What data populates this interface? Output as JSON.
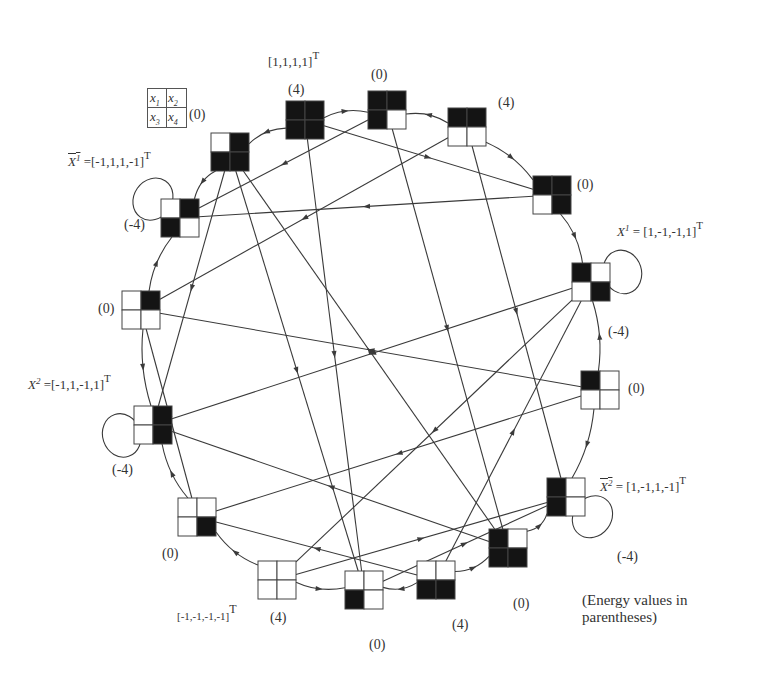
{
  "diagram": {
    "type": "state-transition-graph",
    "colors": {
      "black": "#141414",
      "white": "#ffffff",
      "line": "#3a3a3a"
    },
    "legend_grid": {
      "cells": [
        "x1",
        "x2",
        "x3",
        "x4"
      ],
      "energy": "(0)"
    },
    "nodes": [
      {
        "id": "n1",
        "x": 305,
        "y": 120,
        "state": [
          1,
          1,
          1,
          1
        ],
        "energy": "(4)"
      },
      {
        "id": "n2",
        "x": 387,
        "y": 110,
        "state": [
          1,
          1,
          1,
          0
        ],
        "energy": "(0)"
      },
      {
        "id": "n3",
        "x": 467,
        "y": 127,
        "state": [
          1,
          1,
          0,
          0
        ],
        "energy": "(4)"
      },
      {
        "id": "n4",
        "x": 552,
        "y": 195,
        "state": [
          1,
          1,
          0,
          1
        ],
        "energy": "(0)"
      },
      {
        "id": "n5",
        "x": 591,
        "y": 282,
        "state": [
          1,
          0,
          0,
          1
        ],
        "energy": "(-4)"
      },
      {
        "id": "n6",
        "x": 600,
        "y": 390,
        "state": [
          1,
          0,
          0,
          0
        ],
        "energy": "(0)"
      },
      {
        "id": "n7",
        "x": 566,
        "y": 497,
        "state": [
          1,
          0,
          1,
          0
        ],
        "energy": "(-4)"
      },
      {
        "id": "n8",
        "x": 508,
        "y": 548,
        "state": [
          1,
          0,
          1,
          1
        ],
        "energy": "(0)"
      },
      {
        "id": "n9",
        "x": 436,
        "y": 580,
        "state": [
          0,
          0,
          1,
          1
        ],
        "energy": "(4)"
      },
      {
        "id": "n10",
        "x": 364,
        "y": 590,
        "state": [
          0,
          0,
          1,
          0
        ],
        "energy": "(0)"
      },
      {
        "id": "n11",
        "x": 277,
        "y": 580,
        "state": [
          0,
          0,
          0,
          0
        ],
        "energy": "(4)"
      },
      {
        "id": "n12",
        "x": 197,
        "y": 517,
        "state": [
          0,
          0,
          0,
          1
        ],
        "energy": "(0)"
      },
      {
        "id": "n13",
        "x": 153,
        "y": 425,
        "state": [
          0,
          1,
          0,
          1
        ],
        "energy": "(-4)"
      },
      {
        "id": "n14",
        "x": 141,
        "y": 310,
        "state": [
          0,
          1,
          0,
          0
        ],
        "energy": "(0)"
      },
      {
        "id": "n15",
        "x": 180,
        "y": 218,
        "state": [
          0,
          1,
          1,
          0
        ],
        "energy": "(-4)"
      },
      {
        "id": "n16",
        "x": 230,
        "y": 152,
        "state": [
          0,
          1,
          1,
          1
        ],
        "energy": "(0)"
      }
    ],
    "ring_edges": [
      [
        "n1",
        "n2"
      ],
      [
        "n3",
        "n2"
      ],
      [
        "n3",
        "n4"
      ],
      [
        "n4",
        "n5"
      ],
      [
        "n6",
        "n5"
      ],
      [
        "n6",
        "n7"
      ],
      [
        "n8",
        "n7"
      ],
      [
        "n9",
        "n8"
      ],
      [
        "n9",
        "n10"
      ],
      [
        "n11",
        "n10"
      ],
      [
        "n11",
        "n12"
      ],
      [
        "n12",
        "n13"
      ],
      [
        "n14",
        "n13"
      ],
      [
        "n14",
        "n15"
      ],
      [
        "n16",
        "n15"
      ],
      [
        "n1",
        "n16"
      ]
    ],
    "chord_edges": [
      [
        "n1",
        "n4"
      ],
      [
        "n1",
        "n10"
      ],
      [
        "n2",
        "n15"
      ],
      [
        "n2",
        "n8"
      ],
      [
        "n3",
        "n14"
      ],
      [
        "n3",
        "n7"
      ],
      [
        "n4",
        "n15"
      ],
      [
        "n5",
        "n13"
      ],
      [
        "n5",
        "n11"
      ],
      [
        "n6",
        "n12"
      ],
      [
        "n6",
        "n14"
      ],
      [
        "n8",
        "n13"
      ],
      [
        "n9",
        "n5"
      ],
      [
        "n9",
        "n12"
      ],
      [
        "n10",
        "n7"
      ],
      [
        "n11",
        "n7"
      ],
      [
        "n16",
        "n13"
      ],
      [
        "n16",
        "n10"
      ],
      [
        "n12",
        "n14"
      ],
      [
        "n8",
        "n16"
      ]
    ],
    "self_loops": [
      "n5",
      "n7",
      "n13",
      "n15"
    ]
  },
  "labels": {
    "top_vector": "[1,1,1,1]",
    "top_vector_sup": "T",
    "x1_bar_lhs": "X",
    "x1_bar_sup_idx": "1",
    "x1_bar_rhs": " =[-1,1,1,-1]",
    "x1_lhs": "X",
    "x1_sup_idx": "1",
    "x1_rhs": " = [1,-1,-1,1]",
    "x2_lhs": "X",
    "x2_sup_idx": "2",
    "x2_rhs": " =[-1,1,-1,1]",
    "x2_bar_lhs": "X",
    "x2_bar_sup_idx": "2",
    "x2_bar_rhs": " = [1,-1,1,-1]",
    "bottom_vector": "[-1,-1,-1,-1]",
    "bottom_vector_sup": "T",
    "T": "T",
    "legend_x1": "x",
    "legend_x1_idx": "1",
    "legend_x2": "x",
    "legend_x2_idx": "2",
    "legend_x3": "x",
    "legend_x3_idx": "3",
    "legend_x4": "x",
    "legend_x4_idx": "4",
    "legend_energy": "(0)",
    "note_line1": "(Energy values in",
    "note_line2": "parentheses)"
  },
  "energy_labels": [
    {
      "node": "n1",
      "text": "(4)",
      "x": 288,
      "y": 83
    },
    {
      "node": "n2",
      "text": "(0)",
      "x": 371,
      "y": 68
    },
    {
      "node": "n3",
      "text": "(4)",
      "x": 498,
      "y": 96
    },
    {
      "node": "n4",
      "text": "(0)",
      "x": 577,
      "y": 178
    },
    {
      "node": "n5",
      "text": "(-4)",
      "x": 608,
      "y": 325
    },
    {
      "node": "n6",
      "text": "(0)",
      "x": 628,
      "y": 382
    },
    {
      "node": "n7",
      "text": "(-4)",
      "x": 617,
      "y": 550
    },
    {
      "node": "n8",
      "text": "(0)",
      "x": 513,
      "y": 597
    },
    {
      "node": "n9",
      "text": "(4)",
      "x": 452,
      "y": 618
    },
    {
      "node": "n10",
      "text": "(0)",
      "x": 369,
      "y": 638
    },
    {
      "node": "n11",
      "text": "(4)",
      "x": 270,
      "y": 611
    },
    {
      "node": "n12",
      "text": "(0)",
      "x": 162,
      "y": 547
    },
    {
      "node": "n13",
      "text": "(-4)",
      "x": 112,
      "y": 463
    },
    {
      "node": "n14",
      "text": "(0)",
      "x": 98,
      "y": 302
    },
    {
      "node": "n15",
      "text": "(-4)",
      "x": 124,
      "y": 218
    }
  ]
}
